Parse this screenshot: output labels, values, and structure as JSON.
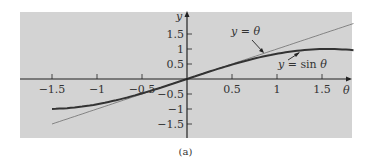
{
  "chart_data": {
    "type": "line",
    "title": "",
    "caption": "(a)",
    "xlabel": "θ",
    "ylabel": "y",
    "xlim": [
      -1.85,
      1.85
    ],
    "ylim": [
      -1.95,
      2.2
    ],
    "grid": false,
    "background": "#d3d3d3",
    "x_ticks": [
      -1.5,
      -1,
      -0.5,
      0.5,
      1,
      1.5
    ],
    "x_tick_labels": [
      "−1.5",
      "−1",
      "−0.5",
      "0.5",
      "1",
      "1.5"
    ],
    "y_ticks": [
      1.5,
      1,
      0.5,
      -0.5,
      -1,
      -1.5
    ],
    "y_tick_labels": [
      "1.5",
      "1",
      "0.5",
      "−0.5",
      "−1",
      "−1.5"
    ],
    "series": [
      {
        "name": "y = θ",
        "function": "theta",
        "x_range": [
          -1.5,
          1.85
        ],
        "color": "#6e6e6e",
        "width": 0.8,
        "x": [
          -1.5,
          -1,
          -0.5,
          0,
          0.5,
          1,
          1.5,
          1.85
        ],
        "values": [
          -1.5,
          -1,
          -0.5,
          0,
          0.5,
          1,
          1.5,
          1.85
        ]
      },
      {
        "name": "y = sin θ",
        "function": "sin",
        "x_range": [
          -1.5,
          1.85
        ],
        "color": "#333333",
        "width": 2,
        "x": [
          -1.5,
          -1,
          -0.5,
          0,
          0.5,
          1,
          1.5,
          1.85
        ],
        "values": [
          -0.997,
          -0.841,
          -0.479,
          0,
          0.479,
          0.841,
          0.997,
          0.961
        ]
      }
    ],
    "annotations": [
      {
        "text_parts": [
          "y",
          " = ",
          "θ"
        ],
        "points_to": "y = θ"
      },
      {
        "text_parts": [
          "y",
          " = sin ",
          "θ"
        ],
        "points_to": "y = sin θ"
      }
    ]
  }
}
